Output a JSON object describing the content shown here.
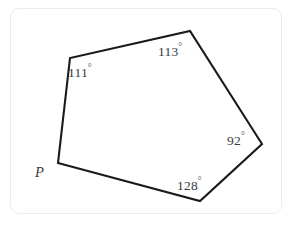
{
  "figure": {
    "background_color": "#ffffff",
    "frame_color": "#ececed",
    "stroke_color": "#1a1a1a",
    "text_color": "#3a3a3c",
    "stroke_width": 2.1,
    "shape": "pentagon",
    "vertices": [
      {
        "id": "P",
        "x": 58,
        "y": 163
      },
      {
        "id": "A",
        "x": 70,
        "y": 58
      },
      {
        "id": "B",
        "x": 190,
        "y": 31
      },
      {
        "id": "C",
        "x": 262,
        "y": 144
      },
      {
        "id": "D",
        "x": 200,
        "y": 201
      }
    ],
    "polygon_points": "58,163 70,58 190,31 262,144 200,201",
    "angle_labels": [
      {
        "id": "angle-111",
        "value": "111",
        "unit": "°",
        "vertex": "A",
        "x": 68,
        "y": 64
      },
      {
        "id": "angle-113",
        "value": "113",
        "unit": "°",
        "vertex": "B",
        "x": 158,
        "y": 43
      },
      {
        "id": "angle-92",
        "value": "92",
        "unit": "°",
        "vertex": "C",
        "x": 227,
        "y": 132
      },
      {
        "id": "angle-128",
        "value": "128",
        "unit": "°",
        "vertex": "D",
        "x": 177,
        "y": 177
      }
    ],
    "vertex_labels": [
      {
        "id": "vertex-P",
        "text": "P",
        "x": 35,
        "y": 165
      }
    ]
  }
}
